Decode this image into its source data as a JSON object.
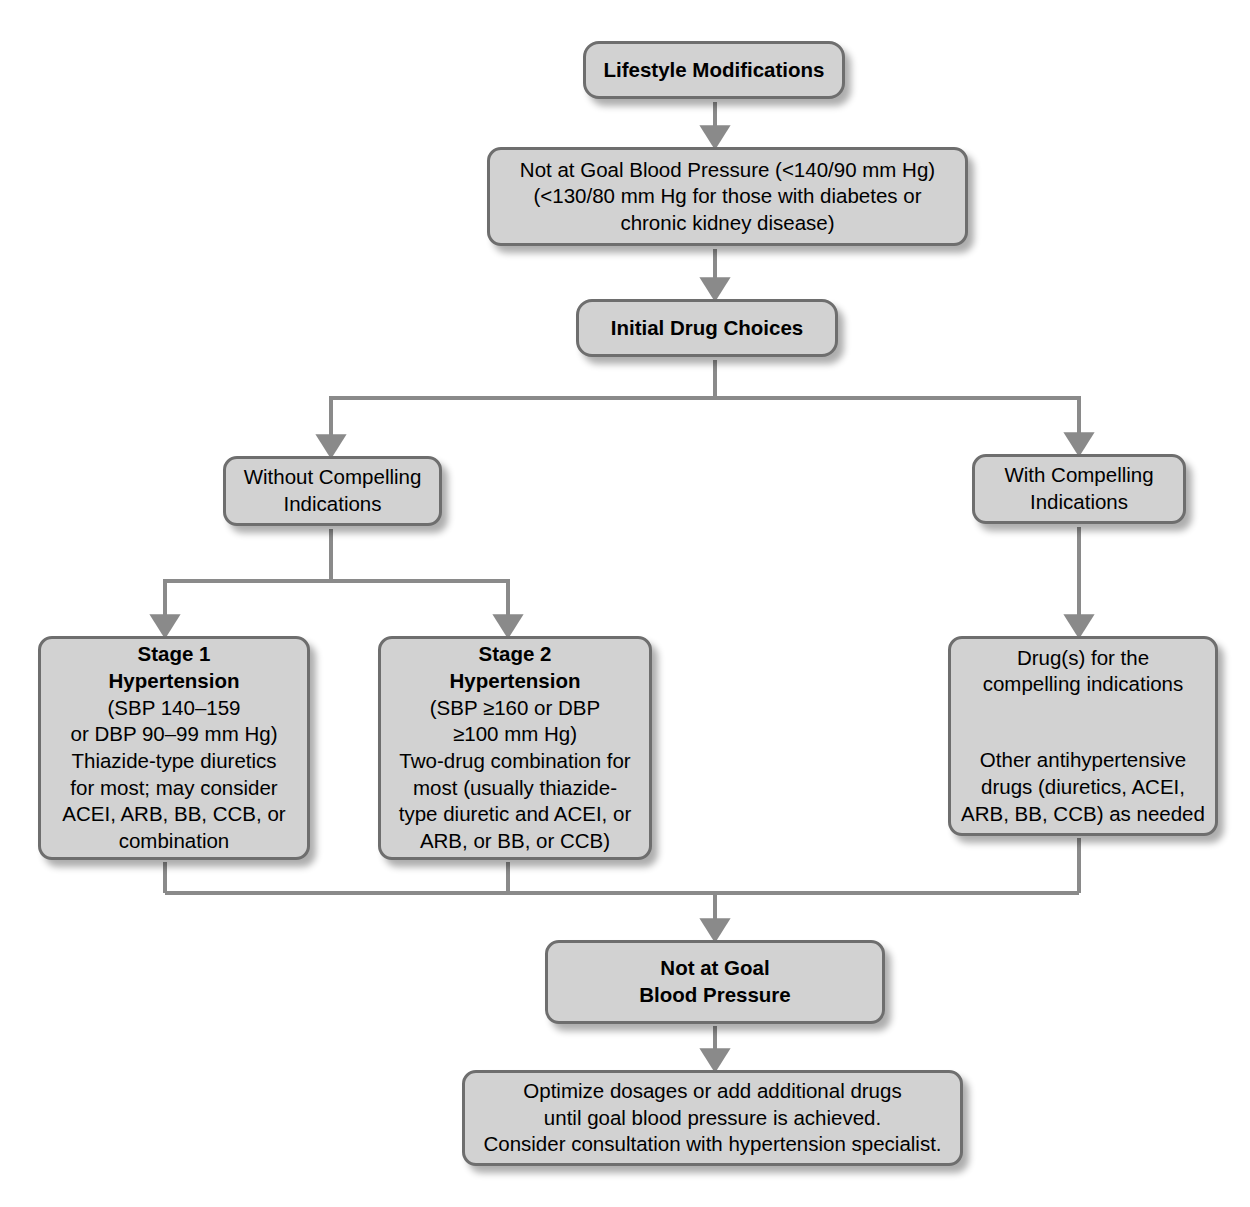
{
  "diagram": {
    "colors": {
      "node_fill": "#d2d2d2",
      "node_border": "#6e6e6e",
      "connector": "#8a8a8a",
      "text": "#000000",
      "background": "#ffffff"
    }
  },
  "nodes": {
    "lifestyle": {
      "label": "Lifestyle Modifications",
      "bold": true
    },
    "not_at_goal_1": {
      "label": "Not at Goal Blood Pressure (<140/90 mm Hg)\n(<130/80 mm Hg for those with diabetes or\nchronic kidney disease)",
      "bold": false
    },
    "initial_drug_choices": {
      "label": "Initial Drug Choices",
      "bold": true
    },
    "without_compelling": {
      "label": "Without Compelling\nIndications",
      "bold": false
    },
    "with_compelling": {
      "label": "With Compelling\nIndications",
      "bold": false
    },
    "stage_1": {
      "heading": "Stage 1\nHypertension",
      "body": "(SBP 140–159\nor DBP 90–99 mm Hg)\nThiazide-type diuretics\nfor most; may consider\nACEI, ARB, BB, CCB, or\ncombination"
    },
    "stage_2": {
      "heading": "Stage 2\nHypertension",
      "body": "(SBP ≥160 or DBP\n≥100 mm Hg)\nTwo-drug combination for\nmost (usually thiazide-\ntype diuretic and ACEI, or\nARB, or BB, or CCB)"
    },
    "compelling_drugs": {
      "body": "Drug(s) for the\ncompelling indications",
      "body2": "Other antihypertensive\ndrugs (diuretics, ACEI,\nARB, BB, CCB) as needed"
    },
    "not_at_goal_2": {
      "label": "Not at Goal\nBlood Pressure",
      "bold": true
    },
    "optimize": {
      "label": "Optimize dosages or add additional drugs\nuntil goal blood pressure is achieved.\nConsider consultation with hypertension specialist.",
      "bold": false
    }
  },
  "edges": [
    {
      "from": "lifestyle",
      "to": "not_at_goal_1",
      "style": "straight-arrow"
    },
    {
      "from": "not_at_goal_1",
      "to": "initial_drug_choices",
      "style": "straight-arrow"
    },
    {
      "from": "initial_drug_choices",
      "to": "without_compelling",
      "style": "split-arrow"
    },
    {
      "from": "initial_drug_choices",
      "to": "with_compelling",
      "style": "split-arrow"
    },
    {
      "from": "without_compelling",
      "to": "stage_1",
      "style": "split-arrow"
    },
    {
      "from": "without_compelling",
      "to": "stage_2",
      "style": "split-arrow"
    },
    {
      "from": "with_compelling",
      "to": "compelling_drugs",
      "style": "straight-arrow"
    },
    {
      "from": "stage_1",
      "to": "not_at_goal_2",
      "style": "merge"
    },
    {
      "from": "stage_2",
      "to": "not_at_goal_2",
      "style": "merge"
    },
    {
      "from": "compelling_drugs",
      "to": "not_at_goal_2",
      "style": "merge"
    },
    {
      "from": "not_at_goal_2",
      "to": "optimize",
      "style": "straight-arrow"
    }
  ]
}
